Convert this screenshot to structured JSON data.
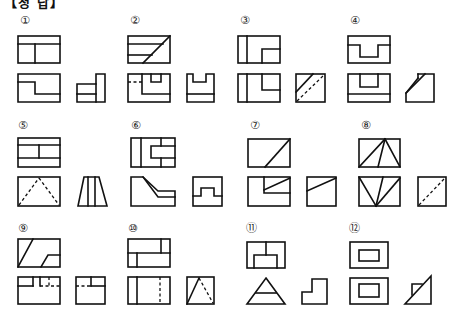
{
  "header": {
    "title": "【정 답】"
  },
  "problems": [
    {
      "number": "①",
      "label_pos": [
        20,
        15
      ]
    },
    {
      "number": "②",
      "label_pos": [
        130,
        15
      ]
    },
    {
      "number": "③",
      "label_pos": [
        240,
        15
      ]
    },
    {
      "number": "④",
      "label_pos": [
        350,
        15
      ]
    },
    {
      "number": "⑤",
      "label_pos": [
        18,
        120
      ]
    },
    {
      "number": "⑥",
      "label_pos": [
        131,
        120
      ]
    },
    {
      "number": "⑦",
      "label_pos": [
        250,
        120
      ]
    },
    {
      "number": "⑧",
      "label_pos": [
        361,
        120
      ]
    },
    {
      "number": "⑨",
      "label_pos": [
        18,
        223
      ]
    },
    {
      "number": "⑩",
      "label_pos": [
        128,
        223
      ]
    },
    {
      "number": "⑪",
      "label_pos": [
        246,
        223
      ]
    },
    {
      "number": "⑫",
      "label_pos": [
        349,
        223
      ]
    }
  ],
  "colors": {
    "line": "#111111",
    "background": "#ffffff"
  },
  "views_per_problem": [
    "top-view",
    "front-view",
    "side-view"
  ]
}
